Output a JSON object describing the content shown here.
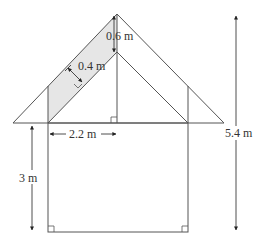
{
  "diagram": {
    "labels": {
      "roof_gap": "0.6 m",
      "rafter_width": "0.4 m",
      "half_span": "2.2 m",
      "wall_height": "3 m",
      "total_height": "5.4 m"
    },
    "colors": {
      "line": "#555555",
      "shade": "#e6e6e6",
      "background": "#ffffff"
    }
  }
}
